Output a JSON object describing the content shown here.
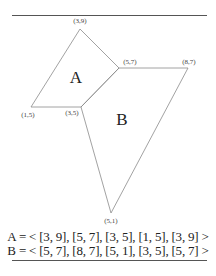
{
  "diagram": {
    "vertices": [
      {
        "id": "v39",
        "label": "(3,9)",
        "x": 80,
        "y": 29,
        "lx": 80,
        "ly": 23
      },
      {
        "id": "v57",
        "label": "(5,7)",
        "x": 119,
        "y": 68,
        "lx": 130,
        "ly": 64
      },
      {
        "id": "v87",
        "label": "(8,7)",
        "x": 188,
        "y": 68,
        "lx": 189,
        "ly": 64
      },
      {
        "id": "v15",
        "label": "(1,5)",
        "x": 31,
        "y": 107,
        "lx": 28,
        "ly": 117
      },
      {
        "id": "v35",
        "label": "(3,5)",
        "x": 81,
        "y": 107,
        "lx": 72,
        "ly": 115
      },
      {
        "id": "v51",
        "label": "(5,1)",
        "x": 111,
        "y": 213,
        "lx": 111,
        "ly": 223
      }
    ],
    "regions": [
      {
        "id": "A",
        "label": "A",
        "x": 76,
        "y": 83
      },
      {
        "id": "B",
        "label": "B",
        "x": 122,
        "y": 125
      }
    ],
    "polygons": {
      "A": "80,29 119,68 81,107 31,107",
      "B": "119,68 188,68 111,213 81,107"
    },
    "sequences": {
      "A": "A = < [3, 9], [5, 7], [3, 5], [1, 5], [3, 9] >",
      "B": "B = < [5, 7], [8, 7], [5, 1], [3, 5], [5, 7] >"
    },
    "colors": {
      "edge": "#888888",
      "text": "#222222"
    }
  }
}
